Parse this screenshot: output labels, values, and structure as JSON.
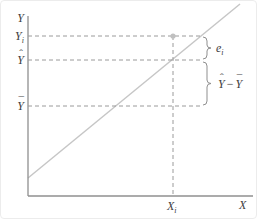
{
  "diagram": {
    "description_visible_text_only": "regression line figure",
    "y_axis_label": "Y",
    "x_axis_label": "X",
    "labels": {
      "observed": {
        "base": "Y",
        "sub": "i"
      },
      "fitted": {
        "base": "Y",
        "accent": "ˆ"
      },
      "mean": {
        "base": "Y",
        "accent": "¯"
      },
      "residual": {
        "base": "e",
        "sub": "i"
      },
      "explained": {
        "first_base": "Y",
        "first_accent": "ˆ",
        "minus": "−",
        "second_base": "Y",
        "second_accent": "¯"
      },
      "x_point": {
        "base": "X",
        "sub": "i"
      }
    },
    "colors": {
      "axis": "#8f8f8f",
      "regression_line": "#c6c6c6",
      "dashed_guide": "#9a9a9a",
      "brace": "#8f8f8f",
      "point": "#c0c0c0",
      "text": "#3d3d3d",
      "background": "#ffffff"
    }
  }
}
